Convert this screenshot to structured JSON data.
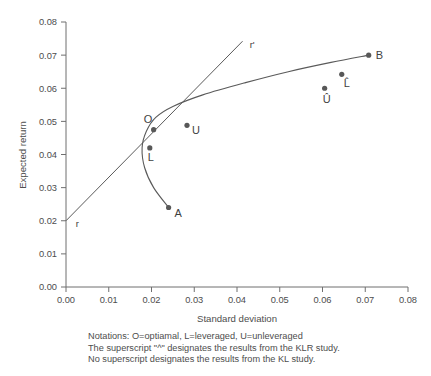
{
  "chart_data": {
    "type": "scatter",
    "title": "",
    "xlabel": "Standard deviation",
    "ylabel": "Expected return",
    "xlim": [
      0.0,
      0.08
    ],
    "ylim": [
      0.0,
      0.08
    ],
    "xticks": [
      "0.00",
      "0.01",
      "0.02",
      "0.03",
      "0.04",
      "0.05",
      "0.06",
      "0.07",
      "0.08"
    ],
    "yticks": [
      "0.00",
      "0.01",
      "0.02",
      "0.03",
      "0.04",
      "0.05",
      "0.06",
      "0.07",
      "0.08"
    ],
    "xtick_values": [
      0.0,
      0.01,
      0.02,
      0.03,
      0.04,
      0.05,
      0.06,
      0.07,
      0.08
    ],
    "ytick_values": [
      0.0,
      0.01,
      0.02,
      0.03,
      0.04,
      0.05,
      0.06,
      0.07,
      0.08
    ],
    "grid": false,
    "legend": "none",
    "points": [
      {
        "label": "O",
        "x": 0.0205,
        "y": 0.0475,
        "label_dx": -10,
        "label_dy": -7,
        "size": "normal"
      },
      {
        "label": "L",
        "x": 0.0196,
        "y": 0.042,
        "label_dx": -2,
        "label_dy": 13,
        "size": "normal"
      },
      {
        "label": "U",
        "x": 0.0283,
        "y": 0.0488,
        "label_dx": 5,
        "label_dy": 9,
        "size": "normal"
      },
      {
        "label": "A",
        "x": 0.024,
        "y": 0.024,
        "label_dx": 6,
        "label_dy": 9,
        "size": "normal"
      },
      {
        "label": "B",
        "x": 0.0708,
        "y": 0.07,
        "label_dx": 7,
        "label_dy": 4,
        "size": "normal"
      },
      {
        "label": "L̂",
        "x": 0.0645,
        "y": 0.0642,
        "label_dx": 2,
        "label_dy": 13,
        "size": "normal"
      },
      {
        "label": "Û",
        "x": 0.0605,
        "y": 0.06,
        "label_dx": -2,
        "label_dy": 15,
        "size": "normal"
      }
    ],
    "annotations": [
      {
        "label": "r",
        "x": 0.0018,
        "y": 0.0192,
        "note": "risk-free intercept label at y=0.02"
      },
      {
        "label": "r'",
        "x": 0.0425,
        "y": 0.0733,
        "note": "capital allocation line end label"
      }
    ],
    "curves": [
      {
        "name": "efficient-frontier",
        "description": "mean-variance frontier bulging left, passing through A, L, O and B",
        "path_points": [
          [
            0.024,
            0.024
          ],
          [
            0.0205,
            0.03
          ],
          [
            0.0184,
            0.036
          ],
          [
            0.0178,
            0.042
          ],
          [
            0.0188,
            0.047
          ],
          [
            0.021,
            0.0512
          ],
          [
            0.025,
            0.0545
          ],
          [
            0.032,
            0.058
          ],
          [
            0.042,
            0.0617
          ],
          [
            0.052,
            0.065
          ],
          [
            0.062,
            0.0678
          ],
          [
            0.0708,
            0.07
          ]
        ]
      },
      {
        "name": "capital-allocation-line",
        "description": "tangent line from risk-free rate r=0.02 at sigma=0 through tangency point O",
        "path_points": [
          [
            0.0,
            0.02
          ],
          [
            0.0413,
            0.0742
          ]
        ]
      }
    ],
    "notes": [
      "Notations: O=optiamal, L=leveraged, U=unleveraged",
      "The superscript \"^\" designates the results from the KLR study.",
      "No superscript designates the results from the KL study."
    ]
  },
  "colors": {
    "marker": "#585858",
    "curve": "#5a5a5a",
    "axis": "#6f6f6f",
    "text": "#4d4d4d",
    "background": "#ffffff"
  }
}
